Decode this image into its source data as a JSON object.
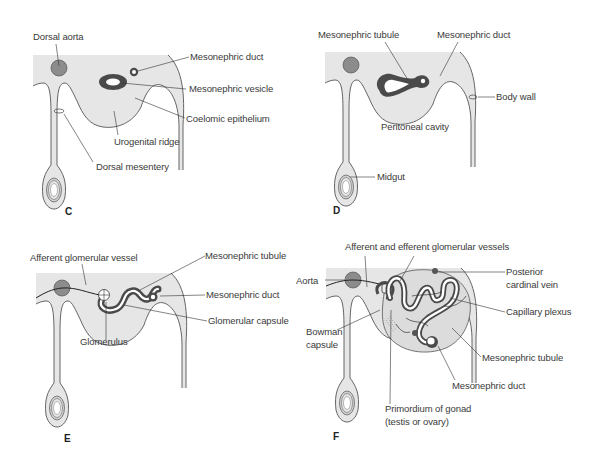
{
  "figure": {
    "colors": {
      "tissue": "#e6e6e6",
      "outline": "#555555",
      "aorta": "#8c8c8c",
      "dark_structure": "#4a4a4a",
      "leader": "#333333",
      "text": "#3a3a3a"
    },
    "panels": [
      {
        "letter": "C",
        "labels": {
          "dorsal_aorta": "Dorsal aorta",
          "mesonephric_duct": "Mesonephric duct",
          "mesonephric_vesicle": "Mesonephric vesicle",
          "coelomic_epithelium": "Coelomic epithelium",
          "urogenital_ridge": "Urogenital ridge",
          "dorsal_mesentery": "Dorsal mesentery"
        }
      },
      {
        "letter": "D",
        "labels": {
          "mesonephric_tubule": "Mesonephric tubule",
          "mesonephric_duct": "Mesonephric duct",
          "body_wall": "Body wall",
          "peritoneal_cavity": "Peritoneal cavity",
          "midgut": "Midgut"
        }
      },
      {
        "letter": "E",
        "labels": {
          "afferent_glomerular_vessel": "Afferent glomerular vessel",
          "mesonephric_tubule": "Mesonephric tubule",
          "mesonephric_duct": "Mesonephric duct",
          "glomerular_capsule": "Glomerular capsule",
          "glomerulus": "Glomerulus"
        }
      },
      {
        "letter": "F",
        "labels": {
          "afferent_efferent_vessels": "Afferent and efferent glomerular vessels",
          "aorta": "Aorta",
          "posterior_cardinal_vein_1": "Posterior",
          "posterior_cardinal_vein_2": "cardinal vein",
          "capillary_plexus": "Capillary plexus",
          "bowman_capsule_1": "Bowman",
          "bowman_capsule_2": "capsule",
          "mesonephric_tubule": "Mesonephric tubule",
          "mesonephric_duct": "Mesonephric duct",
          "primordium_gonad_1": "Primordium of gonad",
          "primordium_gonad_2": "(testis or ovary)"
        }
      }
    ]
  }
}
